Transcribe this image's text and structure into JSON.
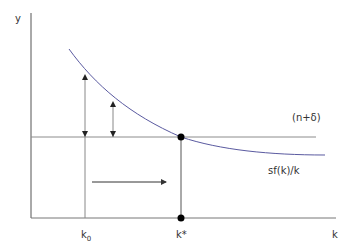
{
  "diagram": {
    "type": "solow-convergence",
    "axes": {
      "y_label": "y",
      "x_label": "k"
    },
    "x_ticks": {
      "k0_main": "k",
      "k0_sub": "0",
      "kstar": "k*"
    },
    "curves": {
      "horizontal_line_label": "(n+δ)",
      "curve_label": "sf(k)/k"
    },
    "colors": {
      "axis": "#555555",
      "horizontal_line": "#8c8c8c",
      "curve": "#5a5aa0",
      "arrow": "#333333",
      "point": "#000000"
    }
  }
}
